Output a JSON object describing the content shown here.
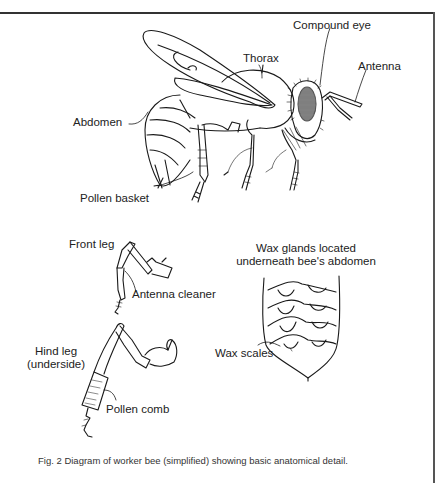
{
  "figure": {
    "caption": "Fig. 2  Diagram of worker bee (simplified) showing basic anatomical detail.",
    "border_color": "#333333",
    "line_color": "#1a1a1a"
  },
  "labels": {
    "thorax": "Thorax",
    "compound_eye": "Compound eye",
    "antenna": "Antenna",
    "abdomen": "Abdomen",
    "pollen_basket": "Pollen basket",
    "front_leg": "Front leg",
    "antenna_cleaner": "Antenna cleaner",
    "wax_glands_line1": "Wax glands located",
    "wax_glands_line2": "underneath bee's abdomen",
    "hind_leg_line1": "Hind leg",
    "hind_leg_line2": "(underside)",
    "pollen_comb": "Pollen comb",
    "wax_scales": "Wax scales"
  },
  "panels": [
    {
      "name": "whole-bee",
      "description": "Side view of worker bee"
    },
    {
      "name": "front-leg",
      "description": "Front leg with antenna cleaner"
    },
    {
      "name": "hind-leg",
      "description": "Hind leg underside with pollen comb"
    },
    {
      "name": "abdomen-underside",
      "description": "Underside of abdomen with wax scales"
    }
  ]
}
